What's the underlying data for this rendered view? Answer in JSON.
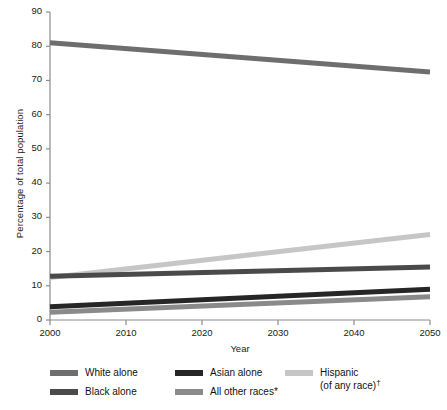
{
  "chart_data": {
    "type": "line",
    "title": "",
    "xlabel": "Year",
    "ylabel": "Percentage of total population",
    "x": [
      2000,
      2050
    ],
    "xlim": [
      2000,
      2050
    ],
    "ylim": [
      0,
      90
    ],
    "xticks": [
      "2000",
      "2010",
      "2020",
      "2030",
      "2040",
      "2050"
    ],
    "xtick_values": [
      2000,
      2010,
      2020,
      2030,
      2040,
      2050
    ],
    "yticks": [
      "0",
      "10",
      "20",
      "30",
      "40",
      "50",
      "60",
      "70",
      "80",
      "90"
    ],
    "ytick_values": [
      0,
      10,
      20,
      30,
      40,
      50,
      60,
      70,
      80,
      90
    ],
    "grid": false,
    "legend_position": "bottom",
    "series": [
      {
        "name": "White alone",
        "values": [
          81.0,
          72.5
        ],
        "color": "#6e6e6e"
      },
      {
        "name": "Black alone",
        "values": [
          12.8,
          15.5
        ],
        "color": "#4a4a4a"
      },
      {
        "name": "Asian alone",
        "values": [
          3.9,
          9.0
        ],
        "color": "#262626"
      },
      {
        "name": "All other races*",
        "values": [
          2.3,
          6.8
        ],
        "color": "#8a8a8a"
      },
      {
        "name": "Hispanic (of any race)†",
        "values": [
          12.4,
          25.0
        ],
        "color": "#c6c6c6"
      }
    ]
  },
  "axes": {
    "ylabel": "Percentage of total population",
    "xlabel": "Year",
    "yticks": [
      "90",
      "80",
      "70",
      "60",
      "50",
      "40",
      "30",
      "20",
      "10",
      "0"
    ],
    "xticks": [
      "2000",
      "2010",
      "2020",
      "2030",
      "2040",
      "2050"
    ]
  },
  "legend": {
    "columns": [
      {
        "entries": [
          {
            "label": "White alone",
            "label2": "",
            "color": "#6e6e6e",
            "swatch": "line-swatch"
          },
          {
            "label": "Black alone",
            "label2": "",
            "color": "#4a4a4a",
            "swatch": "line-swatch"
          }
        ]
      },
      {
        "entries": [
          {
            "label": "Asian alone",
            "label2": "",
            "color": "#262626",
            "swatch": "line-swatch"
          },
          {
            "label": "All other races*",
            "label2": "",
            "color": "#8a8a8a",
            "swatch": "line-swatch"
          }
        ]
      },
      {
        "entries": [
          {
            "label": "Hispanic",
            "label2": "(of any race)†",
            "color": "#c6c6c6",
            "swatch": "line-swatch"
          }
        ]
      }
    ]
  },
  "colors": {
    "axis": "#8c8c8c",
    "text": "#1a1a1a",
    "background": "#ffffff"
  }
}
